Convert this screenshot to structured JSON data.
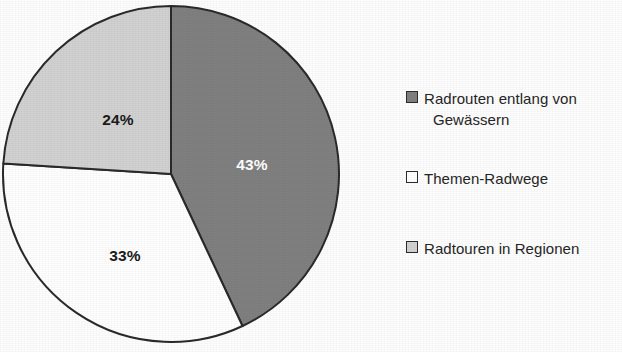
{
  "chart_data": {
    "type": "pie",
    "title": "",
    "labels": [
      "Radrouten entlang von Gewässern",
      "Themen-Radwege",
      "Radtouren in Regionen"
    ],
    "values": [
      43,
      33,
      24
    ],
    "value_labels": [
      "43%",
      "33%",
      "24%"
    ],
    "unit": "%",
    "start_angle_deg": 0,
    "direction": "clockwise",
    "legend_position": "right",
    "grid": false,
    "colors": [
      "#808080",
      "#ffffff",
      "#d2d2d2"
    ],
    "outline_color": "#2a2a2a",
    "slices": [
      {
        "name": "Radrouten entlang von Gewässern",
        "value": 43,
        "value_label": "43%",
        "color": "#808080",
        "label_color": "#ffffff",
        "start_deg": 0,
        "end_deg": 154.8,
        "label_x": 252,
        "label_y": 165
      },
      {
        "name": "Themen-Radwege",
        "value": 33,
        "value_label": "33%",
        "color": "#ffffff",
        "label_color": "#1b1b1b",
        "start_deg": 154.8,
        "end_deg": 273.6,
        "label_x": 125,
        "label_y": 256
      },
      {
        "name": "Radtouren in Regionen",
        "value": 24,
        "value_label": "24%",
        "color": "#d2d2d2",
        "label_color": "#1b1b1b",
        "start_deg": 273.6,
        "end_deg": 360,
        "label_x": 118,
        "label_y": 120
      }
    ],
    "geometry": {
      "center_x": 171,
      "center_y": 174,
      "radius": 168
    }
  },
  "legend": {
    "items": [
      {
        "swatch": "dark-gray-swatch",
        "color": "#808080",
        "line1": "Radrouten entlang von",
        "line2": "Gewässern",
        "top": 10
      },
      {
        "swatch": "white-swatch",
        "color": "#ffffff",
        "line1": "Themen-Radwege",
        "line2": "",
        "top": 90
      },
      {
        "swatch": "light-gray-swatch",
        "color": "#d2d2d2",
        "line1": "Radtouren in Regionen",
        "line2": "",
        "top": 160
      }
    ]
  }
}
